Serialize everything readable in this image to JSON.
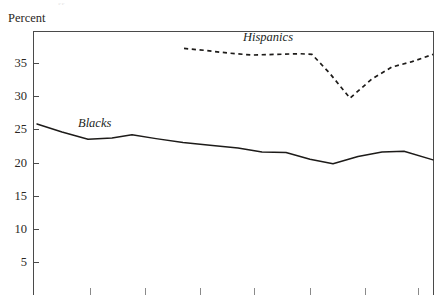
{
  "figure": {
    "axis_title": "Percent",
    "top_clipped_text": "ss",
    "frame": {
      "left": 33,
      "top": 31,
      "right": 434,
      "bottom": 295
    }
  },
  "chart_data": {
    "type": "line",
    "title": "",
    "subtitle": "",
    "xlabel": "",
    "ylabel": "Percent",
    "ylim": [
      0,
      39
    ],
    "yticks": [
      5,
      10,
      15,
      20,
      25,
      30,
      35
    ],
    "ytick_labels": [
      "5",
      "10",
      "15",
      "20",
      "25",
      "30",
      "35"
    ],
    "grid": false,
    "legend_position": "inline-annotation",
    "x_axis_ticks_px": [
      90,
      145,
      200,
      254,
      310,
      365,
      418
    ],
    "annotations": [
      {
        "text": "Blacks",
        "x_px": 78,
        "y_px": 117,
        "style": "italic"
      },
      {
        "text": "Hispanics",
        "x_px": 243,
        "y_px": 31,
        "style": "italic"
      }
    ],
    "series": [
      {
        "name": "Blacks",
        "style": "solid",
        "color": "#1d1b19",
        "points": [
          {
            "x_px": 37,
            "value": 25.8
          },
          {
            "x_px": 62,
            "value": 24.6
          },
          {
            "x_px": 88,
            "value": 23.5
          },
          {
            "x_px": 112,
            "value": 23.7
          },
          {
            "x_px": 132,
            "value": 24.2
          },
          {
            "x_px": 156,
            "value": 23.6
          },
          {
            "x_px": 183,
            "value": 23.0
          },
          {
            "x_px": 210,
            "value": 22.6
          },
          {
            "x_px": 238,
            "value": 22.2
          },
          {
            "x_px": 262,
            "value": 21.6
          },
          {
            "x_px": 286,
            "value": 21.5
          },
          {
            "x_px": 310,
            "value": 20.5
          },
          {
            "x_px": 333,
            "value": 19.8
          },
          {
            "x_px": 358,
            "value": 20.9
          },
          {
            "x_px": 382,
            "value": 21.6
          },
          {
            "x_px": 404,
            "value": 21.7
          },
          {
            "x_px": 433,
            "value": 20.4
          }
        ]
      },
      {
        "name": "Hispanics",
        "style": "dashed",
        "color": "#1d1b19",
        "points": [
          {
            "x_px": 184,
            "value": 37.2
          },
          {
            "x_px": 205,
            "value": 36.9
          },
          {
            "x_px": 228,
            "value": 36.5
          },
          {
            "x_px": 252,
            "value": 36.2
          },
          {
            "x_px": 276,
            "value": 36.3
          },
          {
            "x_px": 300,
            "value": 36.4
          },
          {
            "x_px": 312,
            "value": 36.3
          },
          {
            "x_px": 330,
            "value": 33.4
          },
          {
            "x_px": 350,
            "value": 29.7
          },
          {
            "x_px": 372,
            "value": 32.6
          },
          {
            "x_px": 392,
            "value": 34.4
          },
          {
            "x_px": 412,
            "value": 35.2
          },
          {
            "x_px": 433,
            "value": 36.3
          }
        ]
      }
    ]
  }
}
